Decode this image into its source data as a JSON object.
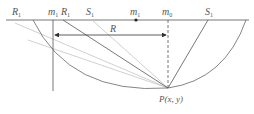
{
  "diagram": {
    "labels": {
      "R1_left": "R",
      "R1_left_sub": "1",
      "m1_left": "m",
      "m1_left_sub": "1",
      "R1_mid": "R",
      "R1_mid_sub": "1",
      "S1_mid": "S",
      "S1_mid_sub": "1",
      "m1_center": "m",
      "m1_center_sub": "1",
      "m0": "m",
      "m0_sub": "0",
      "S1_right": "S",
      "S1_right_sub": "1",
      "radius": "R",
      "point": "P(x, y)"
    },
    "colors": {
      "dark_line": "#555555",
      "light_line": "#bbbbbb",
      "text": "#555555"
    }
  }
}
